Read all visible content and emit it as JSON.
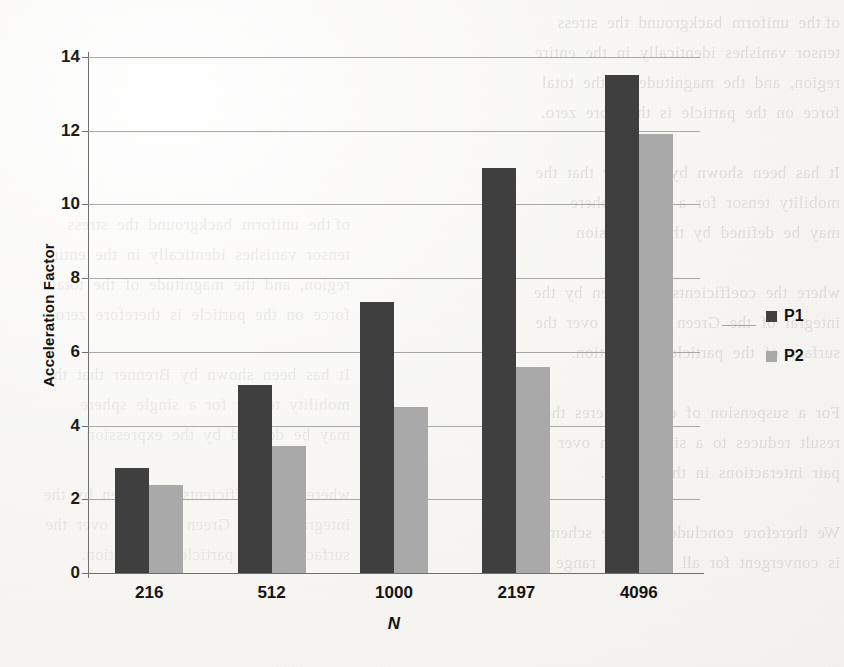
{
  "chart_data": {
    "type": "bar",
    "title": "",
    "xlabel": "N",
    "ylabel": "Acceleration Factor",
    "categories": [
      "216",
      "512",
      "1000",
      "2197",
      "4096"
    ],
    "series": [
      {
        "name": "P1",
        "color": "#3f3f3f",
        "values": [
          2.85,
          5.1,
          7.35,
          11.0,
          13.5
        ]
      },
      {
        "name": "P2",
        "color": "#a9a9a9",
        "values": [
          2.4,
          3.45,
          4.5,
          5.6,
          11.9
        ]
      }
    ],
    "ylim": [
      0,
      14
    ],
    "yticks": [
      0,
      2,
      4,
      6,
      8,
      10,
      12,
      14
    ],
    "ytick_labels": [
      "0",
      "2",
      "4",
      "6",
      "8",
      "10",
      "12",
      "14"
    ],
    "grid": "horizontal",
    "legend_position": "right"
  },
  "legend": {
    "entries": [
      {
        "label": "P1"
      },
      {
        "label": "P2"
      }
    ]
  },
  "page_background": {
    "ghost_text_lines": [
      "of the  uniform  background  the  stress",
      "tensor  vanishes  identically  in  the  entire",
      "region,  and  the  magnitude  of  the  total",
      "force  on  the  particle  is  therefore  zero.",
      "",
      "It  has  been  shown  by  Brenner  that  the",
      "mobility  tensor  for  a  single  sphere",
      "may  be  defined  by  the  expression",
      "",
      "where  the  coefficients  are  given  by  the",
      "integral  of  the  Green  function  over  the",
      "surface  of  the  particle  in  question.",
      "",
      "For  a  suspension  of  equal  spheres  the",
      "result  reduces  to  a  simple  sum  over  all",
      "pair  interactions  in  the  system.",
      "",
      "We  therefore  conclude  that  the  scheme",
      "is  convergent  for  all  N  in  the  range"
    ]
  }
}
